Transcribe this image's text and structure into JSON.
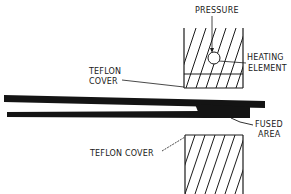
{
  "diagram": {
    "type": "heat-fusion sealing cross-section",
    "labels": {
      "pressure": "PRESSURE",
      "heating_element_line1": "HEATING",
      "heating_element_line2": "ELEMENT",
      "teflon_cover_upper_line1": "TEFLON",
      "teflon_cover_upper_line2": "COVER",
      "fused_area_line1": "FUSED",
      "fused_area_line2": "AREA",
      "teflon_cover_lower": "TEFLON COVER"
    },
    "colors": {
      "ink": "#1a1a1a",
      "background": "#ffffff"
    }
  }
}
